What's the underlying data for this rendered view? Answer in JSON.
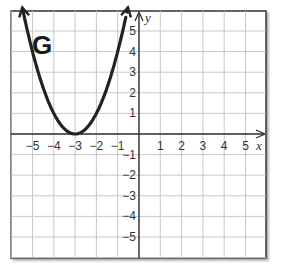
{
  "chart_data": {
    "type": "line",
    "title": "G",
    "xlabel": "x",
    "ylabel": "y",
    "xlim": [
      -5.5,
      6.5
    ],
    "ylim": [
      -6,
      6
    ],
    "grid": true,
    "x_ticks": [
      "-5",
      "-4",
      "-3",
      "-2",
      "-1",
      "1",
      "2",
      "3",
      "4",
      "5"
    ],
    "y_ticks": [
      "5",
      "4",
      "3",
      "2",
      "1",
      "-1",
      "-2",
      "-3",
      "-4",
      "-5"
    ],
    "series": [
      {
        "name": "G",
        "equation": "y = (x + 3)^2",
        "vertex": [
          -3,
          0
        ],
        "x": [
          -5.35,
          -5,
          -4.5,
          -4,
          -3.5,
          -3,
          -2.5,
          -2,
          -1.5,
          -1,
          -0.65
        ],
        "y": [
          5.52,
          4,
          2.25,
          1,
          0.25,
          0,
          0.25,
          1,
          2.25,
          4,
          5.52
        ],
        "arrows_both_ends": true,
        "color": "#222222"
      }
    ]
  },
  "labels": {
    "graph_name": "G",
    "x_axis": "x",
    "y_axis": "y"
  },
  "colors": {
    "grid": "#c8c8c8",
    "axis": "#333333",
    "curve": "#222222",
    "frame": "#333333"
  }
}
